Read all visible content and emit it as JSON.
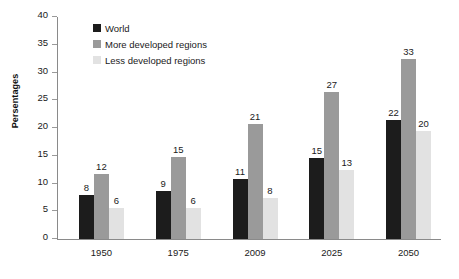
{
  "chart_data": {
    "type": "bar",
    "title": "",
    "xlabel": "",
    "ylabel": "Persentages",
    "ylim": [
      0,
      40
    ],
    "ytick_step": 5,
    "yticks": [
      "40",
      "35",
      "30",
      "25",
      "20",
      "15",
      "10",
      "5",
      "0"
    ],
    "grid": false,
    "legend_position": "top-left-inside",
    "categories": [
      "1950",
      "1975",
      "2009",
      "2025",
      "2050"
    ],
    "series": [
      {
        "name": "World",
        "color": "#1c1c1c",
        "values": [
          8,
          9,
          11,
          15,
          22
        ],
        "plotted": [
          7.9,
          8.7,
          10.8,
          14.6,
          21.4
        ],
        "labels": [
          "8",
          "9",
          "11",
          "15",
          "22"
        ]
      },
      {
        "name": "More developed regions",
        "color": "#9a9a9a",
        "values": [
          12,
          15,
          21,
          27,
          33
        ],
        "plotted": [
          11.7,
          14.8,
          20.7,
          26.4,
          32.4
        ],
        "labels": [
          "12",
          "15",
          "21",
          "27",
          "33"
        ]
      },
      {
        "name": "Less developed regions",
        "color": "#e2e2e2",
        "values": [
          6,
          6,
          8,
          13,
          20
        ],
        "plotted": [
          5.6,
          5.5,
          7.4,
          12.4,
          19.4
        ],
        "labels": [
          "6",
          "6",
          "8",
          "13",
          "20"
        ]
      }
    ]
  },
  "legend": {
    "items": [
      {
        "label": "World",
        "swatch_name": "legend-swatch-world"
      },
      {
        "label": "More developed regions",
        "swatch_name": "legend-swatch-more-developed"
      },
      {
        "label": "Less developed regions",
        "swatch_name": "legend-swatch-less-developed"
      }
    ]
  },
  "colors": {
    "axis": "#8a8a8a",
    "text": "#1a1a1a",
    "background": "#ffffff"
  }
}
